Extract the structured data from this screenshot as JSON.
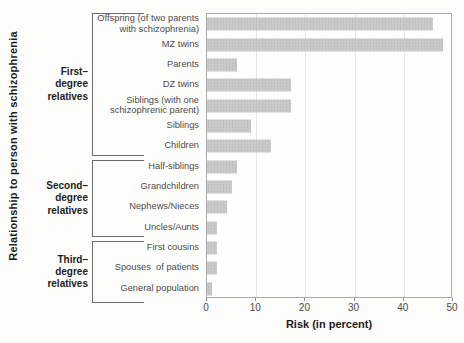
{
  "chart_data": {
    "type": "bar",
    "orientation": "horizontal",
    "xlabel": "Risk (in percent)",
    "ylabel": "Relationship to person with schizophrenia",
    "xlim": [
      0,
      50
    ],
    "x_ticks": [
      "0",
      "10",
      "20",
      "30",
      "40",
      "50"
    ],
    "grid": true,
    "bar_color": "#cacaca",
    "categories": [
      "Offspring (of two parents\nwith schizophrenia)",
      "MZ twins",
      "Parents",
      "DZ twins",
      "Siblings (with one\nschizophrenic parent)",
      "Siblings",
      "Children",
      "Half-siblings",
      "Grandchildren",
      "Nephews/Nieces",
      "Uncles/Aunts",
      "First cousins",
      "Spouses  of patients",
      "General population"
    ],
    "values": [
      46,
      48,
      6,
      17,
      17,
      9,
      13,
      6,
      5,
      4,
      2,
      2,
      2,
      1
    ],
    "groups": [
      {
        "label": "First–\ndegree\nrelatives",
        "start": 0,
        "end": 6
      },
      {
        "label": "Second–\ndegree\nrelatives",
        "start": 7,
        "end": 10
      },
      {
        "label": "Third–\ndegree\nrelatives",
        "start": 11,
        "end": 13
      }
    ]
  }
}
